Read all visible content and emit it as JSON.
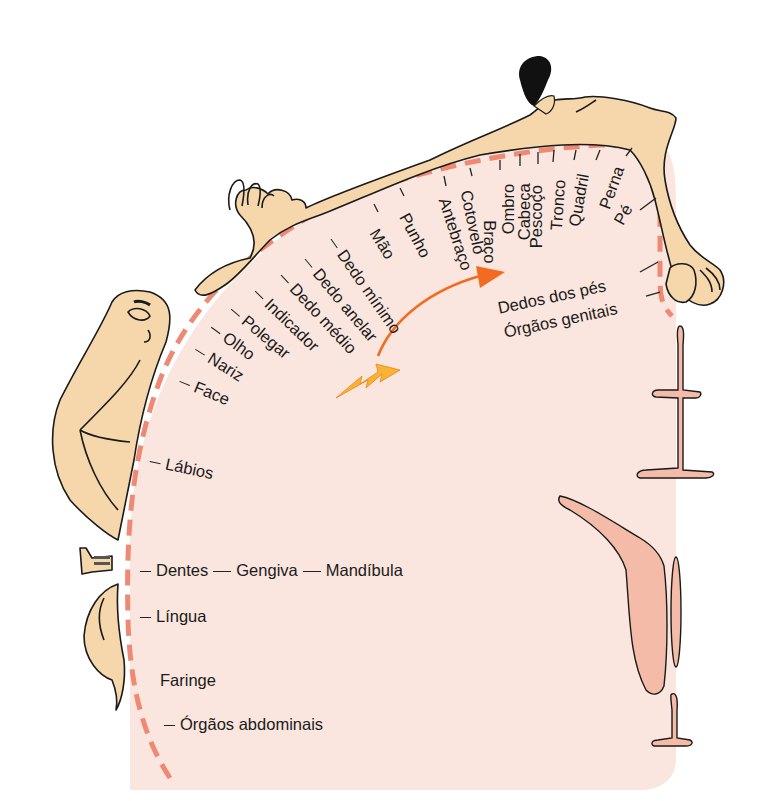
{
  "diagram": {
    "type": "sensory homunculus (somatosensory cortex map)",
    "colors": {
      "cortex_fill": "#fae6de",
      "boundary_dash": "#ee8a74",
      "body_skin": "#f6d7ab",
      "outline": "#1a1a1a",
      "arrow": "#f26b21",
      "bolt": "#f9b233",
      "structure_fill": "#f4bba8",
      "hair": "#111111"
    },
    "labels": {
      "pe": "Pé",
      "perna": "Perna",
      "quadril": "Quadril",
      "tronco": "Tronco",
      "pescoco": "Pescoço",
      "cabeca": "Cabeça",
      "ombro": "Ombro",
      "braco": "Braço",
      "cotovelo": "Cotovelo",
      "antebraco": "Antebraço",
      "punho": "Punho",
      "mao": "Mão",
      "dedo_minimo": "Dedo mínimo",
      "dedo_anelar": "Dedo anelar",
      "dedo_medio": "Dedo médio",
      "indicador": "Indicador",
      "polegar": "Polegar",
      "olho": "Olho",
      "nariz": "Nariz",
      "face": "Face",
      "labios": "Lábios",
      "dentes": "Dentes",
      "gengiva": "Gengiva",
      "mandibula": "Mandíbula",
      "lingua": "Língua",
      "faringe": "Faringe",
      "orgaos_abdominais": "Órgãos abdominais",
      "dedos_dos_pes": "Dedos dos pés",
      "orgaos_genitais": "Órgãos genitais"
    }
  }
}
